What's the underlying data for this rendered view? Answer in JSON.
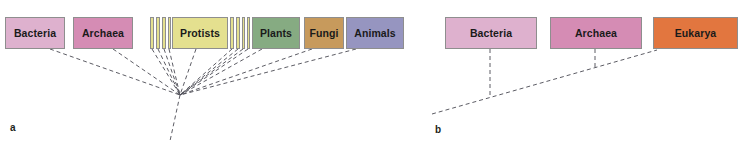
{
  "figure": {
    "width": 744,
    "height": 150,
    "background": "#ffffff"
  },
  "panel_a": {
    "label": "a",
    "label_x": 10,
    "label_y": 122,
    "node": {
      "x": 180,
      "y": 95
    },
    "stem_end": {
      "x": 170,
      "y": 141
    },
    "boxes": [
      {
        "name": "bacteria",
        "label": "Bacteria",
        "x": 5,
        "y": 17,
        "w": 60,
        "h": 32,
        "fill": "#deb1ce",
        "connect_x": 50,
        "connect_y": 49
      },
      {
        "name": "archaea",
        "label": "Archaea",
        "x": 73,
        "y": 17,
        "w": 60,
        "h": 32,
        "fill": "#d58cb4",
        "connect_x": 113,
        "connect_y": 49
      },
      {
        "name": "protists",
        "label": "Protists",
        "x": 172,
        "y": 17,
        "w": 56,
        "h": 32,
        "fill": "#e4e08f",
        "connect_x": 196,
        "connect_y": 49
      },
      {
        "name": "plants",
        "label": "Plants",
        "x": 252,
        "y": 17,
        "w": 48,
        "h": 32,
        "fill": "#86ab82",
        "connect_x": 262,
        "connect_y": 49
      },
      {
        "name": "fungi",
        "label": "Fungi",
        "x": 304,
        "y": 17,
        "w": 40,
        "h": 32,
        "fill": "#c79a5c",
        "connect_x": 312,
        "connect_y": 49
      },
      {
        "name": "animals",
        "label": "Animals",
        "x": 346,
        "y": 17,
        "w": 58,
        "h": 32,
        "fill": "#9695c0",
        "connect_x": 356,
        "connect_y": 49
      }
    ],
    "thin_bars": [
      {
        "name": "protist-lineage-bar-1",
        "x": 150,
        "y": 17,
        "w": 4,
        "h": 32,
        "fill": "#e4e08f",
        "connect_x": 152,
        "connect_y": 49
      },
      {
        "name": "protist-lineage-bar-2",
        "x": 156,
        "y": 17,
        "w": 4,
        "h": 32,
        "fill": "#e4e08f",
        "connect_x": 158,
        "connect_y": 49
      },
      {
        "name": "protist-lineage-bar-3",
        "x": 162,
        "y": 17,
        "w": 4,
        "h": 32,
        "fill": "#e4e08f",
        "connect_x": 164,
        "connect_y": 49
      },
      {
        "name": "protist-lineage-bar-4",
        "x": 168,
        "y": 17,
        "w": 3,
        "h": 32,
        "fill": "#e4e08f",
        "connect_x": 169,
        "connect_y": 49
      },
      {
        "name": "protist-lineage-bar-5",
        "x": 230,
        "y": 17,
        "w": 4,
        "h": 32,
        "fill": "#e4e08f",
        "connect_x": 232,
        "connect_y": 49
      },
      {
        "name": "protist-lineage-bar-6",
        "x": 236,
        "y": 17,
        "w": 4,
        "h": 32,
        "fill": "#e4e08f",
        "connect_x": 238,
        "connect_y": 49
      },
      {
        "name": "protist-lineage-bar-7",
        "x": 242,
        "y": 17,
        "w": 3,
        "h": 32,
        "fill": "#e4e08f",
        "connect_x": 243,
        "connect_y": 49
      },
      {
        "name": "protist-lineage-bar-8",
        "x": 247,
        "y": 17,
        "w": 3,
        "h": 32,
        "fill": "#e4e08f",
        "connect_x": 248,
        "connect_y": 49
      }
    ]
  },
  "panel_b": {
    "label": "b",
    "label_x": 435,
    "label_y": 124,
    "boxes": [
      {
        "name": "bacteria",
        "label": "Bacteria",
        "x": 445,
        "y": 17,
        "w": 92,
        "h": 32,
        "fill": "#deb1ce",
        "drop_x": 490,
        "drop_y": 108
      },
      {
        "name": "archaea",
        "label": "Archaea",
        "x": 550,
        "y": 17,
        "w": 92,
        "h": 32,
        "fill": "#d58cb4",
        "drop_x": 595,
        "drop_y": 79
      },
      {
        "name": "eukarya",
        "label": "Eukarya",
        "x": 653,
        "y": 17,
        "w": 85,
        "h": 32,
        "fill": "#e2763f",
        "drop_x": 655,
        "drop_y": 49
      }
    ],
    "backbone": {
      "x1": 432,
      "y1": 114,
      "x2": 657,
      "y2": 50
    }
  },
  "style": {
    "line_color": "#4a4a52",
    "line_dash": "4,3",
    "line_width": 0.9,
    "box_border": "#8e8e8e"
  },
  "caption": ""
}
